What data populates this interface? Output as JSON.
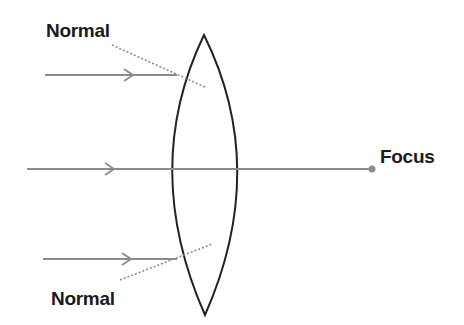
{
  "diagram": {
    "type": "convex-lens-ray-diagram",
    "labels": {
      "normal_top": "Normal",
      "normal_bottom": "Normal",
      "focus": "Focus"
    },
    "colors": {
      "ray": "#8c8c8c",
      "lens": "#222222",
      "normal": "#8c8c8c",
      "focus_dot": "#8c8c8c",
      "text": "#1a1a1a"
    },
    "lens": {
      "top": [
        204,
        35
      ],
      "bottom": [
        205,
        315
      ],
      "left_x": 160,
      "right_x": 248
    },
    "rays": [
      {
        "name": "top-ray",
        "y": 75,
        "x_start": 45,
        "x_end": 177,
        "arrow_x": 133
      },
      {
        "name": "center-ray",
        "y": 169,
        "x_start": 27,
        "x_end": 372,
        "arrow_x": 114
      },
      {
        "name": "bottom-ray",
        "y": 259,
        "x_start": 43,
        "x_end": 177,
        "arrow_x": 131
      }
    ],
    "normals": [
      {
        "name": "top-normal",
        "from": [
          112,
          45
        ],
        "to": [
          205,
          87
        ]
      },
      {
        "name": "bottom-normal",
        "from": [
          120,
          280
        ],
        "to": [
          212,
          244
        ]
      }
    ],
    "focus_point": [
      372,
      169
    ]
  }
}
